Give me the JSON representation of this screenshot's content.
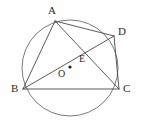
{
  "figure": {
    "background_color": "#fefefe",
    "stroke_color": "#4a4a4a",
    "circle_stroke_color": "#6b6b6b",
    "label_color": "#2b2b2b",
    "stroke_width": 0.9,
    "circle": {
      "name": "circumscribed-circle",
      "center_x": 70,
      "center_y": 68,
      "radius": 48
    },
    "center_dot": {
      "name": "center-point-marker",
      "x": 70,
      "y": 67,
      "radius": 1.6
    },
    "points": [
      {
        "id": "A",
        "label": "A",
        "x": 55,
        "y": 21
      },
      {
        "id": "B",
        "label": "B",
        "x": 23,
        "y": 89
      },
      {
        "id": "C",
        "label": "C",
        "x": 119,
        "y": 89
      },
      {
        "id": "D",
        "label": "D",
        "x": 114,
        "y": 36
      },
      {
        "id": "E",
        "label": "E",
        "x": 78,
        "y": 50
      },
      {
        "id": "O",
        "label": "O",
        "x": 70,
        "y": 67
      }
    ],
    "segments": [
      {
        "name": "segment-AB",
        "from": "A",
        "to": "B",
        "x1": 55,
        "y1": 21,
        "x2": 23,
        "y2": 89
      },
      {
        "name": "segment-AD",
        "from": "A",
        "to": "D",
        "x1": 55,
        "y1": 21,
        "x2": 114,
        "y2": 36
      },
      {
        "name": "segment-AC",
        "from": "A",
        "to": "C",
        "x1": 55,
        "y1": 21,
        "x2": 119,
        "y2": 89
      },
      {
        "name": "segment-BD",
        "from": "B",
        "to": "D",
        "x1": 23,
        "y1": 89,
        "x2": 114,
        "y2": 36
      },
      {
        "name": "segment-BC",
        "from": "B",
        "to": "C",
        "x1": 23,
        "y1": 89,
        "x2": 119,
        "y2": 89
      },
      {
        "name": "segment-DC",
        "from": "D",
        "to": "C",
        "x1": 114,
        "y1": 36,
        "x2": 119,
        "y2": 89
      }
    ],
    "labels": {
      "A": "A",
      "B": "B",
      "C": "C",
      "D": "D",
      "E": "E",
      "O": "O"
    }
  }
}
